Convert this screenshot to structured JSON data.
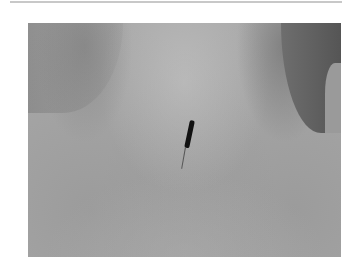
{
  "photo": {
    "subject": "acupuncture needle inserted in skin at base of neck",
    "alt": "Acupuncture needle in upper back near neck"
  }
}
